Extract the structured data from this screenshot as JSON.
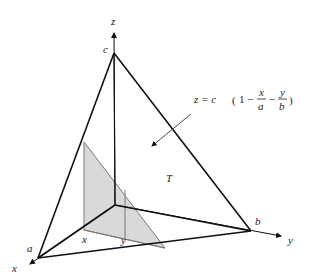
{
  "figure": {
    "type": "3d-tetrahedron-diagram",
    "axes": {
      "x_label": "x",
      "y_label": "y",
      "z_label": "z"
    },
    "intercepts": {
      "a_label": "a",
      "b_label": "b",
      "c_label": "c"
    },
    "region_label": "T",
    "slice_labels": {
      "x_label": "x",
      "y_label": "y"
    },
    "equation": {
      "lhs": "z = c",
      "open": "(",
      "one": "1 −",
      "frac1_num": "x",
      "frac1_den": "a",
      "minus": "−",
      "frac2_num": "y",
      "frac2_den": "b",
      "close": ")"
    },
    "colors": {
      "line": "#111111",
      "shade": "#d9d9d9",
      "shade_edge": "#777777"
    }
  }
}
